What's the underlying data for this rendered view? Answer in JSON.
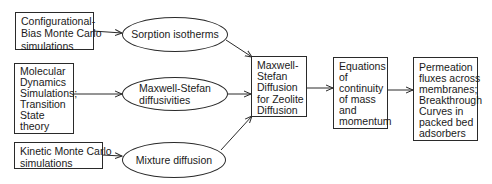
{
  "inputs": [
    {
      "id": "cbmc",
      "lines": [
        "Configurational-",
        "Bias Monte Carlo",
        "simulations"
      ]
    },
    {
      "id": "md",
      "lines": [
        "Molecular",
        "Dynamics",
        "Simulations;",
        "Transition",
        "State",
        "theory"
      ]
    },
    {
      "id": "kmc",
      "lines": [
        "Kinetic Monte Carlo",
        "simulations"
      ]
    }
  ],
  "properties": [
    {
      "id": "sorption",
      "lines": [
        "Sorption isotherms"
      ]
    },
    {
      "id": "ms_diff",
      "lines": [
        "Maxwell-Stefan",
        "diffusivities"
      ]
    },
    {
      "id": "mixture",
      "lines": [
        "Mixture diffusion"
      ]
    }
  ],
  "core": {
    "id": "ms_zeolite",
    "lines": [
      "Maxwell-",
      "Stefan",
      "Diffusion",
      "for Zeolite",
      "Diffusion"
    ]
  },
  "equations": {
    "id": "continuity",
    "lines": [
      "Equations",
      "of",
      "continuity",
      "of mass",
      "and",
      "momentum"
    ]
  },
  "output": {
    "id": "permeation",
    "lines": [
      "Permeation",
      "fluxes across",
      "membranes;",
      "Breakthrough",
      "Curves in",
      "packed bed",
      "adsorbers"
    ]
  },
  "edges": [
    {
      "from": "cbmc",
      "to": "sorption"
    },
    {
      "from": "md",
      "to": "ms_diff"
    },
    {
      "from": "kmc",
      "to": "mixture"
    },
    {
      "from": "sorption",
      "to": "ms_zeolite"
    },
    {
      "from": "ms_diff",
      "to": "ms_zeolite"
    },
    {
      "from": "mixture",
      "to": "ms_zeolite"
    },
    {
      "from": "ms_zeolite",
      "to": "continuity"
    },
    {
      "from": "continuity",
      "to": "permeation"
    }
  ]
}
